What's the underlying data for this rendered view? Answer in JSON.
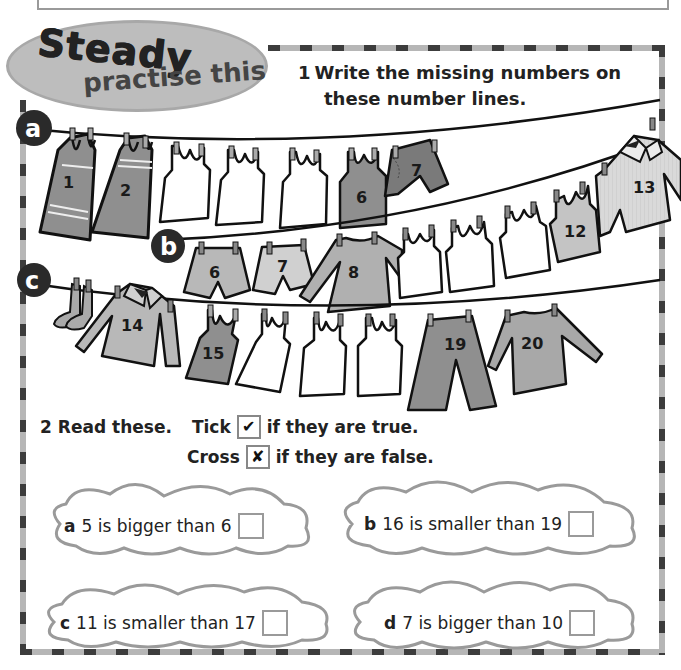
{
  "header": {
    "badge_title": "Steady",
    "badge_subtitle": "practise this"
  },
  "question1": {
    "number": "1",
    "text_line1": "Write the missing numbers on",
    "text_line2": "these number lines.",
    "lines": [
      {
        "label": "a",
        "items": [
          {
            "garment": "dress",
            "value": "1"
          },
          {
            "garment": "dress",
            "value": "2"
          },
          {
            "garment": "vest",
            "value": ""
          },
          {
            "garment": "vest",
            "value": ""
          },
          {
            "garment": "vest",
            "value": ""
          },
          {
            "garment": "vest",
            "value": "6"
          },
          {
            "garment": "shorts",
            "value": "7"
          }
        ]
      },
      {
        "label": "b",
        "items": [
          {
            "garment": "shorts",
            "value": "6"
          },
          {
            "garment": "shorts",
            "value": "7"
          },
          {
            "garment": "jumper",
            "value": "8"
          },
          {
            "garment": "vest",
            "value": ""
          },
          {
            "garment": "vest",
            "value": ""
          },
          {
            "garment": "vest",
            "value": ""
          },
          {
            "garment": "vest",
            "value": "12"
          },
          {
            "garment": "shirt",
            "value": "13"
          }
        ]
      },
      {
        "label": "c",
        "items": [
          {
            "garment": "socks",
            "value": ""
          },
          {
            "garment": "shirt",
            "value": "14"
          },
          {
            "garment": "vest",
            "value": "15"
          },
          {
            "garment": "vest",
            "value": ""
          },
          {
            "garment": "vest",
            "value": ""
          },
          {
            "garment": "vest",
            "value": ""
          },
          {
            "garment": "trousers",
            "value": "19"
          },
          {
            "garment": "jumper",
            "value": "20"
          }
        ]
      }
    ]
  },
  "question2": {
    "number": "2",
    "intro": "Read these.",
    "tick_label": "Tick",
    "tick_symbol": "✔",
    "tick_rule": "if they are true.",
    "cross_label": "Cross",
    "cross_symbol": "✘",
    "cross_rule": "if they are false.",
    "statements": [
      {
        "letter": "a",
        "text": "5 is bigger than 6"
      },
      {
        "letter": "b",
        "text": "16 is smaller than 19"
      },
      {
        "letter": "c",
        "text": "11 is smaller than 17"
      },
      {
        "letter": "d",
        "text": "7 is bigger than 10"
      }
    ]
  },
  "colors": {
    "dark_gray": "#3c3c3c",
    "mid_gray": "#8f8f8f",
    "light_gray": "#bdbdbd",
    "pale_gray": "#d6d6d6",
    "ink": "#1a1a1a"
  }
}
